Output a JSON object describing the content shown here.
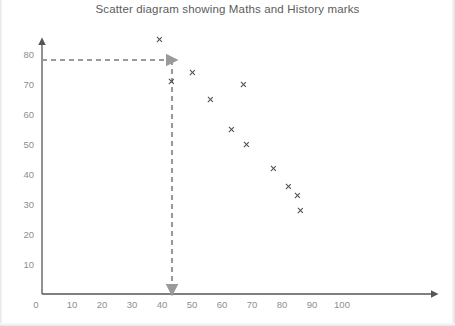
{
  "chart_data": {
    "type": "scatter",
    "title": "Scatter diagram showing Maths and History marks",
    "xlabel": "",
    "ylabel": "",
    "xlim": [
      0,
      110
    ],
    "ylim": [
      0,
      88
    ],
    "xticks": [
      10,
      20,
      30,
      40,
      50,
      60,
      70,
      80,
      90,
      100
    ],
    "yticks": [
      0,
      10,
      20,
      30,
      40,
      50,
      60,
      70,
      80
    ],
    "origin_label": "0",
    "grid": false,
    "legend": null,
    "marker_symbol": "x",
    "marker_color": "#4a4a4a",
    "points": [
      {
        "x": 39,
        "y": 85
      },
      {
        "x": 43,
        "y": 71
      },
      {
        "x": 50,
        "y": 74
      },
      {
        "x": 56,
        "y": 65
      },
      {
        "x": 63,
        "y": 55
      },
      {
        "x": 67,
        "y": 70
      },
      {
        "x": 68,
        "y": 50
      },
      {
        "x": 77,
        "y": 42
      },
      {
        "x": 82,
        "y": 36
      },
      {
        "x": 85,
        "y": 33
      },
      {
        "x": 86,
        "y": 28
      }
    ],
    "annotations": [
      {
        "name": "horizontal-guide",
        "type": "dashed-arrow",
        "orientation": "horizontal",
        "value": 78,
        "from_x": 42,
        "to_x": 60,
        "color": "#9a9a9a"
      },
      {
        "name": "vertical-guide",
        "type": "dashed-arrow",
        "orientation": "vertical",
        "value": 43,
        "from_y": 78,
        "to_y": 0,
        "color": "#9a9a9a"
      }
    ],
    "axis_color": "#555555",
    "tick_label_color": "#8e8e8e"
  }
}
